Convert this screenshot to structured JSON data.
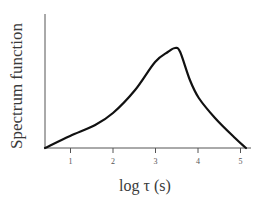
{
  "chart_data": {
    "type": "line",
    "title": "",
    "xlabel": "log τ (s)",
    "ylabel": "Spectrum function",
    "xlim": [
      0.4,
      5.2
    ],
    "ylim": [
      0,
      1.2
    ],
    "x_ticks": [
      "1",
      "2",
      "3",
      "4",
      "5"
    ],
    "y_ticks": [],
    "grid": false,
    "legend": null,
    "series": [
      {
        "name": "Spectrum function",
        "x": [
          0.4,
          0.99,
          1.58,
          2.0,
          2.52,
          2.99,
          3.29,
          3.46,
          3.58,
          3.81,
          4.02,
          4.4,
          4.87,
          5.13
        ],
        "y": [
          0.0,
          0.12,
          0.23,
          0.35,
          0.58,
          0.86,
          0.96,
          1.0,
          0.96,
          0.68,
          0.5,
          0.3,
          0.1,
          0.0
        ]
      }
    ]
  }
}
